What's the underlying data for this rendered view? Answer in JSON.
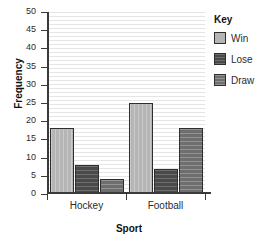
{
  "chart_data": {
    "type": "bar",
    "title": "",
    "xlabel": "Sport",
    "ylabel": "Frequency",
    "categories": [
      "Hockey",
      "Football"
    ],
    "series": [
      {
        "name": "Win",
        "values": [
          18,
          25
        ],
        "color": "#b5b5b5"
      },
      {
        "name": "Lose",
        "values": [
          8,
          7
        ],
        "color": "#4a4a4a"
      },
      {
        "name": "Draw",
        "values": [
          4,
          18
        ],
        "color": "#6e6e6e"
      }
    ],
    "ylim": [
      0,
      50
    ],
    "ytick_step": 5,
    "yticks": [
      0,
      5,
      10,
      15,
      20,
      25,
      30,
      35,
      40,
      45,
      50
    ],
    "grid": true,
    "grid_axis": "y",
    "legend_position": "right"
  },
  "legend": {
    "title": "Key",
    "entries": [
      {
        "label": "Win"
      },
      {
        "label": "Lose"
      },
      {
        "label": "Draw"
      }
    ]
  },
  "axes": {
    "y_title": "Frequency",
    "x_title": "Sport"
  }
}
